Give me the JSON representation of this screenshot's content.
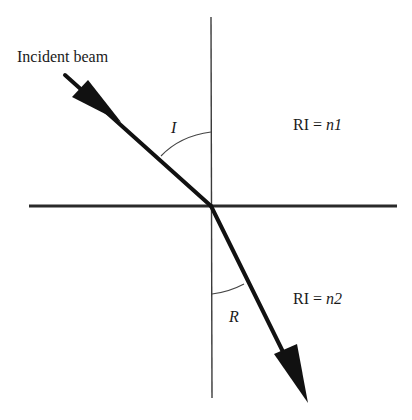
{
  "diagram": {
    "type": "refraction",
    "labels": {
      "incident_beam": "Incident beam",
      "angle_incidence": "I",
      "angle_refraction": "R",
      "medium_top_prefix": "RI = ",
      "medium_top_var": "n1",
      "medium_bottom_prefix": "RI = ",
      "medium_bottom_var": "n2"
    },
    "geometry": {
      "origin": [
        211,
        206
      ],
      "interface_line": {
        "x1": 29,
        "y1": 206,
        "x2": 397,
        "y2": 206
      },
      "normal_line": {
        "x1": 211,
        "y1": 17,
        "x2": 212,
        "y2": 398
      },
      "incident_ray": {
        "x1": 65,
        "y1": 75,
        "x2": 211,
        "y2": 206
      },
      "refracted_ray": {
        "x1": 211,
        "y1": 206,
        "x2": 308,
        "y2": 403
      }
    },
    "colors": {
      "line": "#1a1a1a",
      "background": "#ffffff"
    }
  }
}
